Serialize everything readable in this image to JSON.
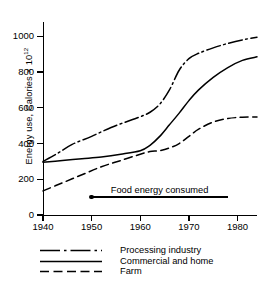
{
  "chart_data": {
    "type": "line",
    "title": "",
    "xlabel": "",
    "ylabel": "Energy use, Calories × 10",
    "ylabel_exponent": "12",
    "xlim": [
      1940,
      1984
    ],
    "ylim": [
      0,
      1080
    ],
    "grid": false,
    "legend_position": "below-axes",
    "x_ticks": [
      1940,
      1950,
      1960,
      1970,
      1980
    ],
    "x_tick_labels": [
      "1940",
      "1950",
      "1960",
      "1970",
      "1980"
    ],
    "y_ticks": [
      0,
      200,
      400,
      600,
      800,
      1000
    ],
    "y_tick_labels": [
      "0",
      "200",
      "400",
      "600",
      "800",
      "1000"
    ],
    "series": [
      {
        "name": "Processing industry",
        "style": "dash-dot",
        "x": [
          1940,
          1943,
          1946,
          1950,
          1954,
          1958,
          1960,
          1962,
          1964,
          1966,
          1968,
          1970,
          1972,
          1975,
          1978,
          1981,
          1984
        ],
        "values": [
          300,
          345,
          395,
          440,
          490,
          530,
          550,
          575,
          620,
          700,
          810,
          875,
          905,
          935,
          960,
          980,
          995
        ]
      },
      {
        "name": "Commercial and home",
        "style": "solid",
        "x": [
          1940,
          1944,
          1948,
          1952,
          1956,
          1960,
          1962,
          1964,
          1966,
          1968,
          1970,
          1972,
          1975,
          1978,
          1981,
          1984
        ],
        "values": [
          295,
          305,
          315,
          325,
          340,
          360,
          390,
          440,
          505,
          570,
          640,
          700,
          770,
          825,
          865,
          885
        ]
      },
      {
        "name": "Farm",
        "style": "dashed",
        "x": [
          1940,
          1944,
          1948,
          1952,
          1956,
          1960,
          1962,
          1964,
          1966,
          1968,
          1970,
          1972,
          1975,
          1978,
          1981,
          1984
        ],
        "values": [
          135,
          180,
          225,
          270,
          305,
          340,
          355,
          360,
          375,
          400,
          440,
          480,
          520,
          540,
          547,
          548
        ]
      }
    ],
    "annotation": {
      "text": "Food energy consumed",
      "x_start": 1950,
      "x_end": 1978,
      "y": 100,
      "marker": "dot-at-start"
    }
  },
  "legend": {
    "items": [
      {
        "label": "Processing industry",
        "style": "dash-dot",
        "sample_name": "legend-sample-dash-dot"
      },
      {
        "label": "Commercial and home",
        "style": "solid",
        "sample_name": "legend-sample-solid"
      },
      {
        "label": "Farm",
        "style": "dashed",
        "sample_name": "legend-sample-dashed"
      }
    ]
  },
  "caption": {
    "partial_text": ""
  },
  "colors": {
    "ink": "#000000",
    "background": "#ffffff"
  }
}
